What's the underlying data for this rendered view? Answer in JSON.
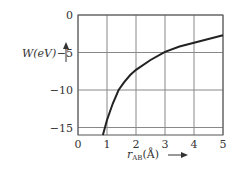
{
  "chart_data": {
    "type": "line",
    "title": "",
    "xlabel": "r_AB (Å)",
    "ylabel": "W(eV)",
    "xlim": [
      0,
      5
    ],
    "ylim": [
      -16,
      0
    ],
    "grid": true,
    "xticks": [
      0,
      1,
      2,
      3,
      4,
      5
    ],
    "yticks": [
      0,
      -5,
      -10,
      -15
    ],
    "series": [
      {
        "name": "W(r_AB)",
        "x": [
          0.86,
          1.0,
          1.2,
          1.4,
          1.6,
          1.8,
          2.0,
          2.5,
          3.0,
          3.5,
          4.0,
          4.5,
          5.0
        ],
        "y": [
          -16.0,
          -14.0,
          -11.8,
          -10.0,
          -8.9,
          -8.0,
          -7.3,
          -6.0,
          -4.9,
          -4.2,
          -3.7,
          -3.2,
          -2.7
        ]
      }
    ]
  },
  "labels": {
    "y_axis": "W(eV)",
    "x_axis_main": "r",
    "x_axis_sub": "AB",
    "x_axis_unit": "(Å)",
    "x_arrow": "⟶",
    "y_arrow": "↑",
    "xtick_labels": [
      "0",
      "1",
      "2",
      "3",
      "4",
      "5"
    ],
    "ytick_labels": [
      "0",
      "−5",
      "−10",
      "−15"
    ]
  }
}
